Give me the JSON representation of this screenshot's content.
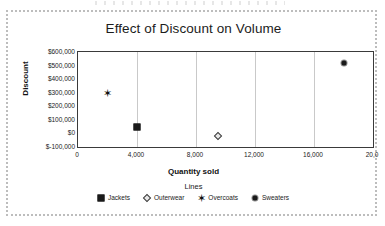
{
  "chart_data": {
    "type": "scatter",
    "title": "Effect of Discount on Volume",
    "xlabel": "Quantity sold",
    "ylabel": "Discount",
    "xlim": [
      0,
      20000
    ],
    "ylim": [
      -100000,
      600000
    ],
    "grid": "vertical",
    "legend_title": "Lines",
    "legend_position": "bottom",
    "x_ticks": [
      "0",
      "4,000",
      "8,000",
      "12,000",
      "16,000",
      "20,0"
    ],
    "x_tick_values": [
      0,
      4000,
      8000,
      12000,
      16000,
      20000
    ],
    "y_ticks": [
      "$600,000",
      "$500,000",
      "$400,000",
      "$300,000",
      "$200,000",
      "$100,000",
      "$0",
      "$-100,000"
    ],
    "y_tick_values": [
      600000,
      500000,
      400000,
      300000,
      200000,
      100000,
      0,
      -100000
    ],
    "series": [
      {
        "name": "Jackets",
        "marker": "square",
        "x": [
          4000
        ],
        "y": [
          50000
        ]
      },
      {
        "name": "Outerwear",
        "marker": "diamond",
        "x": [
          9500
        ],
        "y": [
          -20000
        ]
      },
      {
        "name": "Overcoats",
        "marker": "star",
        "x": [
          2000
        ],
        "y": [
          300000
        ]
      },
      {
        "name": "Sweaters",
        "marker": "circle",
        "x": [
          18000
        ],
        "y": [
          520000
        ]
      }
    ]
  },
  "chart": {
    "title": "Effect of Discount on Volume",
    "x_axis_title": "Quantity sold",
    "y_axis_title": "Discount",
    "legend_title": "Lines"
  },
  "colors": {
    "marker": "#1a1a1a",
    "gridline": "#c9c9c9",
    "axis": "#3a3a3a",
    "background": "#ffffff"
  }
}
